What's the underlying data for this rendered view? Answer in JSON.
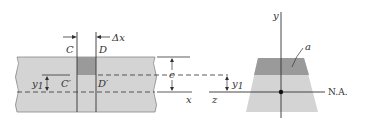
{
  "diagram": {
    "colors": {
      "beam_fill": "#d4d4d4",
      "element_fill": "#9a9a9a",
      "section_light": "#d4d4d4",
      "section_dark": "#9a9a9a",
      "line": "#333333"
    },
    "beam_view": {
      "labels": {
        "C": "C",
        "D": "D",
        "delta_x": "Δx",
        "C_prime": "C′",
        "D_prime": "D′",
        "y1": "y",
        "y1_sub": "1",
        "c": "c",
        "x_axis": "x"
      }
    },
    "cross_section": {
      "labels": {
        "y_axis": "y",
        "z_axis": "z",
        "area": "a",
        "y1": "y",
        "y1_sub": "1",
        "neutral_axis": "N.A."
      }
    }
  }
}
